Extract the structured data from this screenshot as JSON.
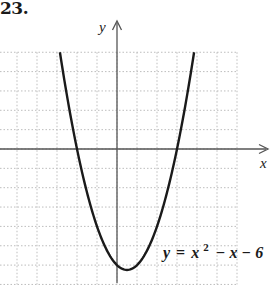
{
  "problem": {
    "number": "23."
  },
  "chart_data": {
    "type": "line",
    "title": "",
    "xlabel": "x",
    "ylabel": "y",
    "equation_label": "y = x² − x − 6",
    "equation_parts": {
      "lhs": "y",
      "eq": "=",
      "x": "x",
      "exp": "2",
      "rest": "− x − 6"
    },
    "function": "x^2 - x - 6",
    "grid": true,
    "grid_spacing": 1,
    "xlim": [
      -5.85,
      6
    ],
    "ylim": [
      -7,
      5
    ],
    "x_intercepts": [
      -2,
      3
    ],
    "y_intercept": -6,
    "vertex": [
      0.5,
      -6.25
    ],
    "x": [
      -2.854,
      -2.5,
      -2,
      -1.5,
      -1,
      -0.5,
      0,
      0.5,
      1,
      1.5,
      2,
      2.5,
      3,
      3.5,
      3.854
    ],
    "values": [
      5,
      2.75,
      0,
      -2.25,
      -4,
      -5.25,
      -6,
      -6.25,
      -6,
      -5.25,
      -4,
      -2.25,
      0,
      2.75,
      5
    ],
    "tick_labels": false
  },
  "colors": {
    "curve": "#1a1a1a",
    "axis": "#555555",
    "grid": "#bdbdbd"
  }
}
